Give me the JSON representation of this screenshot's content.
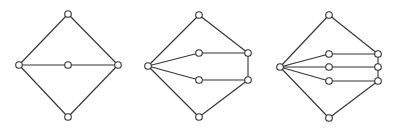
{
  "diagram": {
    "title": "",
    "colors": {
      "edge": "#333333",
      "node_fill": "#ffffff",
      "node_stroke": "#333333",
      "background": "#ffffff"
    },
    "graphs": [
      {
        "id": "graph-1",
        "description": "Diamond with one internal path through a middle node",
        "nodes": [
          "top",
          "left",
          "mid-1",
          "right",
          "bottom"
        ],
        "edges": [
          [
            "left",
            "top"
          ],
          [
            "top",
            "right"
          ],
          [
            "left",
            "bottom"
          ],
          [
            "bottom",
            "right"
          ],
          [
            "left",
            "mid-1"
          ],
          [
            "mid-1",
            "right"
          ]
        ]
      },
      {
        "id": "graph-2",
        "description": "Diamond with two internal paths; right vertex split into two linked nodes",
        "nodes": [
          "top",
          "left",
          "mid-1",
          "mid-2",
          "right-1",
          "right-2",
          "bottom"
        ],
        "edges": [
          [
            "left",
            "top"
          ],
          [
            "top",
            "right-1"
          ],
          [
            "left",
            "bottom"
          ],
          [
            "bottom",
            "right-2"
          ],
          [
            "left",
            "mid-1"
          ],
          [
            "mid-1",
            "right-1"
          ],
          [
            "left",
            "mid-2"
          ],
          [
            "mid-2",
            "right-2"
          ],
          [
            "right-1",
            "right-2"
          ]
        ]
      },
      {
        "id": "graph-3",
        "description": "Diamond with three internal paths; right vertex split into three chained nodes",
        "nodes": [
          "top",
          "left",
          "mid-1",
          "mid-2",
          "mid-3",
          "right-1",
          "right-2",
          "right-3",
          "bottom"
        ],
        "edges": [
          [
            "left",
            "top"
          ],
          [
            "top",
            "right-1"
          ],
          [
            "left",
            "bottom"
          ],
          [
            "bottom",
            "right-3"
          ],
          [
            "left",
            "mid-1"
          ],
          [
            "mid-1",
            "right-1"
          ],
          [
            "left",
            "mid-2"
          ],
          [
            "mid-2",
            "right-2"
          ],
          [
            "left",
            "mid-3"
          ],
          [
            "mid-3",
            "right-3"
          ],
          [
            "right-1",
            "right-2"
          ],
          [
            "right-2",
            "right-3"
          ]
        ]
      }
    ]
  }
}
